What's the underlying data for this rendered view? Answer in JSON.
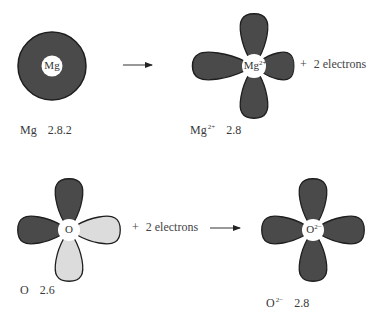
{
  "colors": {
    "dark_fill": "#4a4a4a",
    "light_fill": "#dcdcdc",
    "outline": "#1e1e1e",
    "text": "#3a3a3a",
    "background": "#ffffff"
  },
  "reaction_magnesium": {
    "reactant": {
      "symbol": "Mg",
      "charge": "",
      "configuration": "2.8.2",
      "center_label": "Mg"
    },
    "arrow": "→",
    "product": {
      "symbol": "Mg",
      "charge": "2+",
      "configuration": "2.8",
      "center_label": "Mg",
      "center_charge": "2+"
    },
    "byproduct": {
      "plus": "+",
      "text": "2 electrons"
    }
  },
  "reaction_oxygen": {
    "reactant": {
      "symbol": "O",
      "charge": "",
      "configuration": "2.6",
      "center_label": "O"
    },
    "addend": {
      "plus": "+",
      "text": "2 electrons"
    },
    "arrow": "→",
    "product": {
      "symbol": "O",
      "charge": "2−",
      "configuration": "2.8",
      "center_label": "O",
      "center_charge": "2−"
    }
  }
}
